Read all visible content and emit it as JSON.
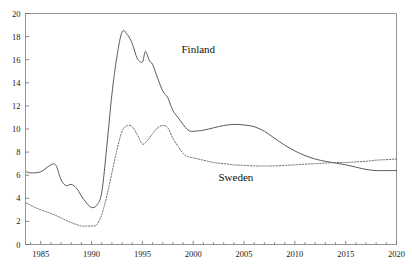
{
  "chart_data": {
    "type": "line",
    "title": "",
    "subtitle": "",
    "xlabel": "",
    "ylabel": "",
    "xlim": [
      1983.5,
      2020
    ],
    "ylim": [
      0,
      20
    ],
    "grid": false,
    "legend_position": "inline-annotation",
    "x_tick_labels": [
      "1985",
      "1990",
      "1995",
      "2000",
      "2005",
      "2010",
      "2015",
      "2020"
    ],
    "x_tick_values": [
      1985,
      1990,
      1995,
      2000,
      2005,
      2010,
      2015,
      2020
    ],
    "x_minor_tick_step": 1,
    "y_tick_labels": [
      "0",
      "2",
      "4",
      "6",
      "8",
      "10",
      "12",
      "14",
      "16",
      "18",
      "20"
    ],
    "y_tick_values": [
      0,
      2,
      4,
      6,
      8,
      10,
      12,
      14,
      16,
      18,
      20
    ],
    "annotations": [
      {
        "text": "Finland",
        "x": 2000.5,
        "y": 16.6
      },
      {
        "text": "Sweden",
        "x": 2004.2,
        "y": 5.5
      }
    ],
    "series": [
      {
        "name": "Finland",
        "style": "solid",
        "color": "#3d3d3d",
        "x": [
          1983.6,
          1984,
          1985,
          1986,
          1986.5,
          1987,
          1987.5,
          1988,
          1988.5,
          1989,
          1989.5,
          1990,
          1990.5,
          1991,
          1991.5,
          1992,
          1992.5,
          1993,
          1993.5,
          1994,
          1994.5,
          1995,
          1995.3,
          1995.7,
          1996,
          1996.5,
          1997,
          1997.5,
          1998,
          1998.5,
          1999,
          1999.5,
          2000,
          2001,
          2002,
          2003,
          2004,
          2005,
          2006,
          2007,
          2008,
          2009,
          2010,
          2011,
          2012,
          2013,
          2014,
          2015,
          2016,
          2017,
          2018,
          2019,
          2020
        ],
        "y": [
          6.3,
          6.2,
          6.3,
          6.9,
          6.85,
          5.6,
          5.1,
          5.2,
          4.9,
          4.2,
          3.6,
          3.2,
          3.4,
          4.5,
          8.5,
          13.0,
          16.3,
          18.4,
          18.2,
          17.4,
          16.1,
          15.8,
          16.7,
          15.9,
          15.6,
          14.4,
          13.3,
          12.7,
          11.6,
          11.0,
          10.4,
          9.9,
          9.8,
          9.9,
          10.1,
          10.3,
          10.4,
          10.35,
          10.2,
          9.8,
          9.2,
          8.6,
          8.1,
          7.7,
          7.4,
          7.2,
          7.05,
          6.9,
          6.7,
          6.5,
          6.4,
          6.4,
          6.4
        ]
      },
      {
        "name": "Sweden",
        "style": "dotted",
        "color": "#6a6a6a",
        "x": [
          1983.6,
          1984,
          1985,
          1986,
          1987,
          1988,
          1989,
          1989.5,
          1990,
          1990.5,
          1991,
          1991.5,
          1992,
          1992.5,
          1993,
          1993.5,
          1994,
          1994.5,
          1995,
          1995.5,
          1996,
          1996.5,
          1997,
          1997.5,
          1998,
          1998.5,
          1999,
          1999.5,
          2000,
          2001,
          2002,
          2003,
          2004,
          2005,
          2006,
          2007,
          2008,
          2009,
          2010,
          2011,
          2012,
          2013,
          2014,
          2015,
          2016,
          2017,
          2018,
          2019,
          2020
        ],
        "y": [
          3.6,
          3.4,
          3.0,
          2.7,
          2.3,
          1.9,
          1.6,
          1.6,
          1.6,
          1.7,
          2.6,
          4.2,
          6.2,
          8.2,
          9.8,
          10.3,
          10.2,
          9.5,
          8.7,
          9.0,
          9.6,
          10.1,
          10.3,
          10.1,
          9.2,
          8.5,
          7.9,
          7.6,
          7.5,
          7.3,
          7.1,
          7.0,
          6.9,
          6.85,
          6.8,
          6.8,
          6.8,
          6.85,
          6.9,
          6.95,
          7.0,
          7.05,
          7.1,
          7.1,
          7.15,
          7.2,
          7.3,
          7.35,
          7.4
        ]
      }
    ]
  },
  "axes": {
    "frame_color": "#8a8a8a",
    "tick_color": "#6a6a6a"
  }
}
